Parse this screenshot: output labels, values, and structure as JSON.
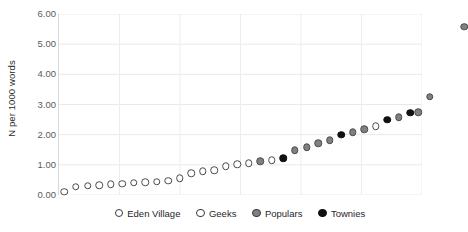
{
  "chart_data": {
    "type": "scatter",
    "title": "",
    "xlabel": "",
    "ylabel": "N per 1000 words",
    "ylim": [
      0,
      6
    ],
    "xlim": [
      0,
      30
    ],
    "grid": true,
    "grid_axes": "both",
    "legend_position": "bottom-center",
    "ytick_labels": [
      "6.00",
      "5.00",
      "4.00",
      "3.00",
      "2.00",
      "1.00",
      "0.00"
    ],
    "ytick_values": [
      6,
      5,
      4,
      3,
      2,
      1,
      0
    ],
    "xtick_labels": [],
    "series": [
      {
        "name": "Eden Village",
        "marker": "open-circle",
        "color": "#ffffff",
        "edge_color": "#4a4a4a",
        "points": []
      },
      {
        "name": "Geeks",
        "marker": "open-circle",
        "color": "#ffffff",
        "edge_color": "#4a4a4a",
        "points": []
      },
      {
        "name": "Populars",
        "marker": "filled-circle",
        "color": "#808080",
        "edge_color": "#4a4a4a",
        "points": []
      },
      {
        "name": "Townies",
        "marker": "filled-circle",
        "color": "#111111",
        "edge_color": "#111111",
        "points": []
      }
    ],
    "points": [
      {
        "x": 0.45,
        "y": 0.1,
        "group": "open"
      },
      {
        "x": 1.4,
        "y": 0.27,
        "group": "open"
      },
      {
        "x": 2.35,
        "y": 0.3,
        "group": "open"
      },
      {
        "x": 3.3,
        "y": 0.33,
        "group": "open"
      },
      {
        "x": 4.25,
        "y": 0.36,
        "group": "open"
      },
      {
        "x": 5.2,
        "y": 0.38,
        "group": "open"
      },
      {
        "x": 6.15,
        "y": 0.4,
        "group": "open"
      },
      {
        "x": 7.1,
        "y": 0.42,
        "group": "open"
      },
      {
        "x": 8.05,
        "y": 0.44,
        "group": "open"
      },
      {
        "x": 9.0,
        "y": 0.48,
        "group": "open"
      },
      {
        "x": 9.95,
        "y": 0.55,
        "group": "open"
      },
      {
        "x": 10.9,
        "y": 0.72,
        "group": "open"
      },
      {
        "x": 11.85,
        "y": 0.78,
        "group": "open"
      },
      {
        "x": 12.8,
        "y": 0.82,
        "group": "open"
      },
      {
        "x": 13.75,
        "y": 0.95,
        "group": "open"
      },
      {
        "x": 14.7,
        "y": 1.02,
        "group": "open"
      },
      {
        "x": 15.65,
        "y": 1.06,
        "group": "open"
      },
      {
        "x": 16.6,
        "y": 1.12,
        "group": "gray"
      },
      {
        "x": 17.55,
        "y": 1.15,
        "group": "open"
      },
      {
        "x": 18.5,
        "y": 1.22,
        "group": "black"
      },
      {
        "x": 19.45,
        "y": 1.48,
        "group": "gray"
      },
      {
        "x": 20.4,
        "y": 1.58,
        "group": "gray"
      },
      {
        "x": 21.35,
        "y": 1.72,
        "group": "gray"
      },
      {
        "x": 22.3,
        "y": 1.82,
        "group": "gray"
      },
      {
        "x": 23.25,
        "y": 2.0,
        "group": "black"
      },
      {
        "x": 24.2,
        "y": 2.08,
        "group": "gray"
      },
      {
        "x": 25.15,
        "y": 2.18,
        "group": "gray"
      },
      {
        "x": 26.1,
        "y": 2.28,
        "group": "open"
      },
      {
        "x": 27.05,
        "y": 2.5,
        "group": "black"
      },
      {
        "x": 28.0,
        "y": 2.58,
        "group": "gray"
      },
      {
        "x": 28.95,
        "y": 2.72,
        "group": "black"
      },
      {
        "x": 29.6,
        "y": 2.75,
        "group": "gray"
      },
      {
        "x": 30.55,
        "y": 3.25,
        "group": "gray"
      },
      {
        "x": 33.4,
        "y": 5.58,
        "group": "gray"
      }
    ]
  },
  "axis": {
    "y_title": "N per 1000 words"
  },
  "legend": {
    "items": [
      {
        "label": "Eden Village",
        "marker": "open"
      },
      {
        "label": "Geeks",
        "marker": "open"
      },
      {
        "label": "Populars",
        "marker": "gray"
      },
      {
        "label": "Townies",
        "marker": "black"
      }
    ]
  }
}
